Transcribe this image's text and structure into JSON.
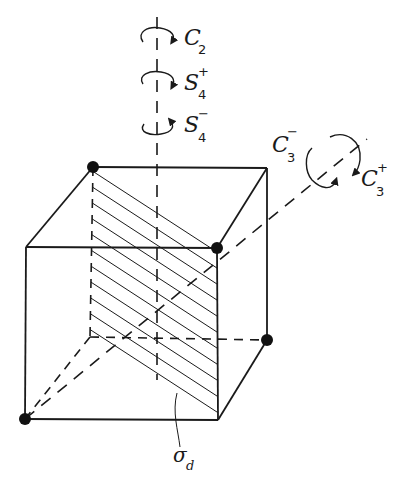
{
  "figure": {
    "colors": {
      "ink": "#1a1a1a",
      "background": "#ffffff"
    }
  },
  "labels": {
    "c2": {
      "base": "C",
      "sub": "2",
      "sup": ""
    },
    "s4_plus": {
      "base": "S",
      "sub": "4",
      "sup": "+"
    },
    "s4_minus": {
      "base": "S",
      "sub": "4",
      "sup": "−"
    },
    "c3_minus": {
      "base": "C",
      "sub": "3",
      "sup": "−"
    },
    "c3_plus": {
      "base": "C",
      "sub": "3",
      "sup": "+"
    },
    "sigma_d": {
      "base": "σ",
      "sub": "d",
      "sup": ""
    }
  },
  "vertices_marked": 4
}
